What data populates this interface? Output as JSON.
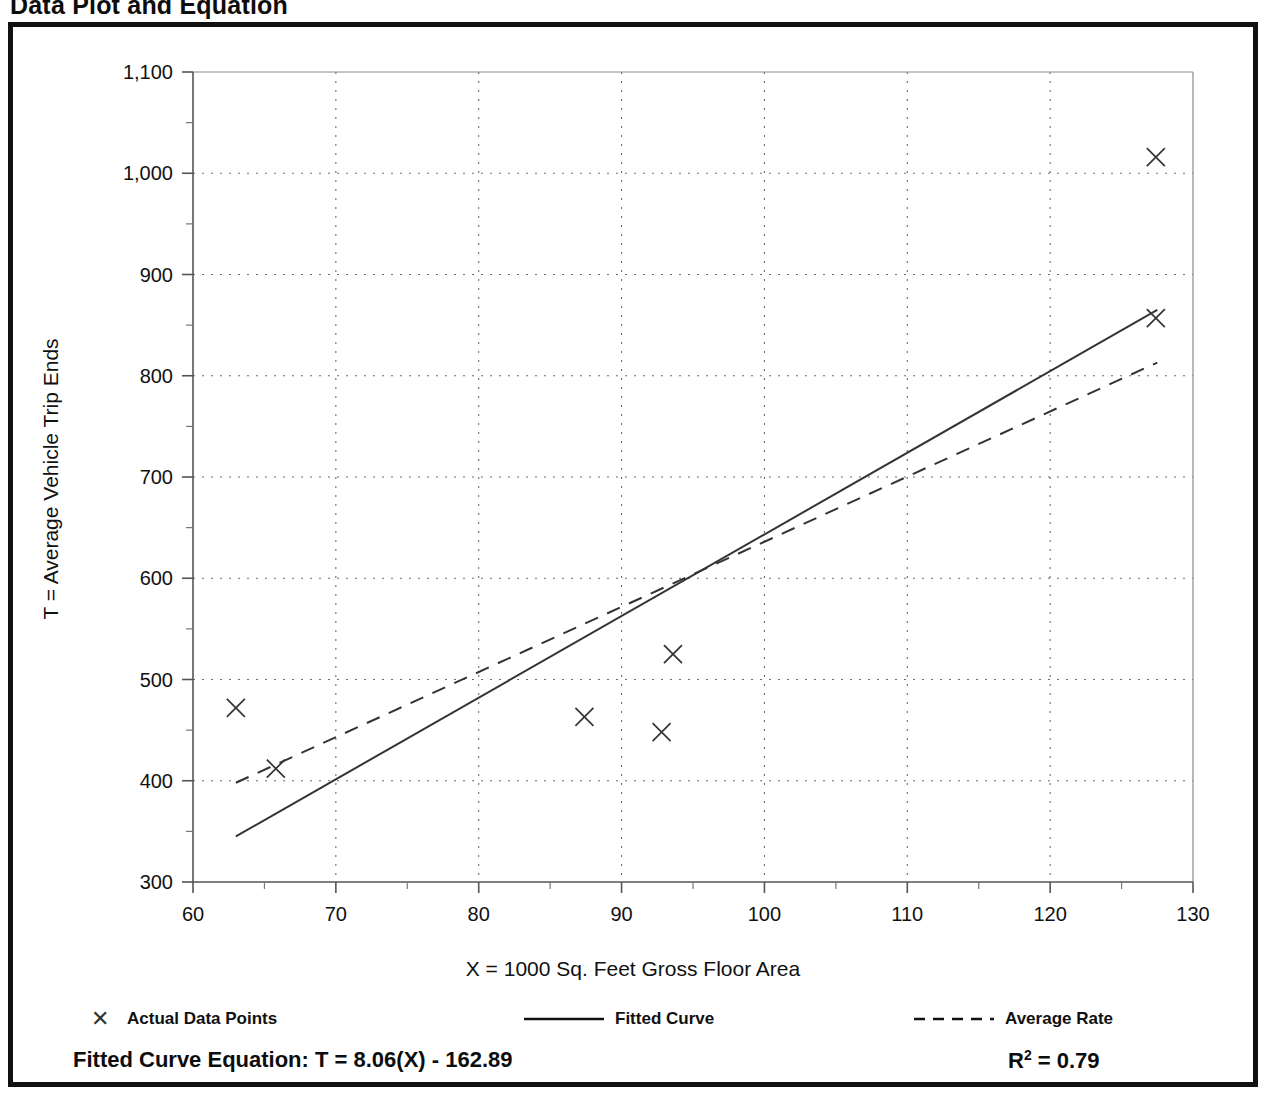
{
  "page": {
    "title": "Data Plot and Equation"
  },
  "legend": {
    "items": [
      {
        "label": "Actual Data Points",
        "marker": "x-marker-icon",
        "style": "marker"
      },
      {
        "label": "Fitted Curve",
        "marker": "solid-line-icon",
        "style": "solid"
      },
      {
        "label": "Average Rate",
        "marker": "dashed-line-icon",
        "style": "dashed"
      }
    ]
  },
  "footer": {
    "equation_label": "Fitted Curve Equation:",
    "equation": "T = 8.06(X) - 162.89",
    "equation_full": "Fitted Curve Equation:  T = 8.06(X) - 162.89",
    "r_squared_symbol": "R",
    "r_squared_exponent": "2",
    "r_squared_value": "= 0.79",
    "r_squared_full": "R2 = 0.79"
  },
  "chart_data": {
    "type": "scatter",
    "title": "Data Plot and Equation",
    "xlabel": "X = 1000 Sq. Feet Gross Floor Area",
    "ylabel": "T = Average Vehicle Trip Ends",
    "xlim": [
      60,
      130
    ],
    "ylim": [
      300,
      1100
    ],
    "grid": true,
    "grid_style": "dotted",
    "xticks": [
      60,
      70,
      80,
      90,
      100,
      110,
      120,
      130
    ],
    "xtick_labels": [
      "60",
      "70",
      "80",
      "90",
      "100",
      "110",
      "120",
      "130"
    ],
    "xminor_step": 5,
    "yticks": [
      300,
      400,
      500,
      600,
      700,
      800,
      900,
      1000,
      1100
    ],
    "ytick_labels": [
      "300",
      "400",
      "500",
      "600",
      "700",
      "800",
      "900",
      "1,000",
      "1,100"
    ],
    "yminor_step": 50,
    "legend_position": "below",
    "series": [
      {
        "name": "Actual Data Points",
        "type": "scatter",
        "marker": "x",
        "color": "#333333",
        "points": [
          {
            "x": 63.0,
            "y": 472
          },
          {
            "x": 65.8,
            "y": 412
          },
          {
            "x": 87.4,
            "y": 463
          },
          {
            "x": 92.8,
            "y": 448
          },
          {
            "x": 93.6,
            "y": 525
          },
          {
            "x": 127.4,
            "y": 1016
          },
          {
            "x": 127.4,
            "y": 857
          }
        ]
      },
      {
        "name": "Fitted Curve",
        "type": "line",
        "style": "solid",
        "color": "#333333",
        "equation": "T = 8.06(X) - 162.89",
        "slope": 8.06,
        "intercept": -162.89,
        "r_squared": 0.79,
        "endpoints": [
          {
            "x": 63.0,
            "y": 345
          },
          {
            "x": 127.5,
            "y": 865
          }
        ]
      },
      {
        "name": "Average Rate",
        "type": "line",
        "style": "dashed",
        "color": "#333333",
        "endpoints": [
          {
            "x": 63.0,
            "y": 398
          },
          {
            "x": 127.5,
            "y": 813
          }
        ]
      }
    ]
  }
}
